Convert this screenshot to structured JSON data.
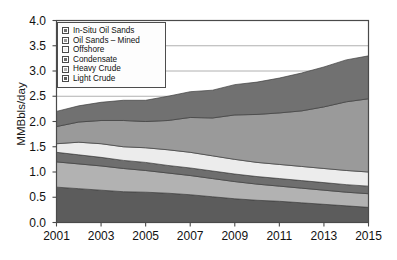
{
  "chart_data": {
    "type": "area",
    "title": "",
    "subtitle": "",
    "xlabel": "",
    "ylabel": "MMBbls/day",
    "stacked": true,
    "grid": true,
    "legend_position": "top-left",
    "xlim": [
      2001,
      2015
    ],
    "ylim": [
      0.0,
      4.0
    ],
    "ytick_labels": [
      "0.0",
      "0.5",
      "1.0",
      "1.5",
      "2.0",
      "2.5",
      "3.0",
      "3.5",
      "4.0"
    ],
    "ytick_values": [
      0.0,
      0.5,
      1.0,
      1.5,
      2.0,
      2.5,
      3.0,
      3.5,
      4.0
    ],
    "xtick_labels": [
      "2001",
      "2003",
      "2005",
      "2007",
      "2009",
      "2011",
      "2013",
      "2015"
    ],
    "xtick_values": [
      2001,
      2003,
      2005,
      2007,
      2009,
      2011,
      2013,
      2015
    ],
    "x": [
      2001,
      2002,
      2003,
      2004,
      2005,
      2006,
      2007,
      2008,
      2009,
      2010,
      2011,
      2012,
      2013,
      2014,
      2015
    ],
    "series": [
      {
        "name": "Light Crude",
        "color": "#5c5c5c",
        "values": [
          0.7,
          0.67,
          0.64,
          0.61,
          0.6,
          0.58,
          0.55,
          0.51,
          0.47,
          0.44,
          0.42,
          0.39,
          0.36,
          0.33,
          0.3
        ]
      },
      {
        "name": "Heavy Crude",
        "color": "#b2b2b2",
        "values": [
          0.5,
          0.49,
          0.48,
          0.46,
          0.43,
          0.4,
          0.38,
          0.36,
          0.34,
          0.32,
          0.3,
          0.29,
          0.28,
          0.27,
          0.27
        ]
      },
      {
        "name": "Condensate",
        "color": "#6e6e6e",
        "values": [
          0.19,
          0.18,
          0.17,
          0.16,
          0.16,
          0.15,
          0.15,
          0.15,
          0.15,
          0.15,
          0.15,
          0.15,
          0.15,
          0.15,
          0.15
        ]
      },
      {
        "name": "Offshore",
        "color": "#ececec",
        "values": [
          0.17,
          0.25,
          0.27,
          0.27,
          0.29,
          0.31,
          0.31,
          0.3,
          0.29,
          0.28,
          0.28,
          0.28,
          0.28,
          0.28,
          0.28
        ]
      },
      {
        "name": "Oil Sands – Mined",
        "color": "#9a9a9a",
        "values": [
          0.34,
          0.4,
          0.46,
          0.52,
          0.52,
          0.58,
          0.69,
          0.75,
          0.88,
          0.95,
          1.02,
          1.1,
          1.22,
          1.36,
          1.45
        ]
      },
      {
        "name": "In-Situ Oil Sands",
        "color": "#717171",
        "values": [
          0.3,
          0.32,
          0.36,
          0.4,
          0.42,
          0.48,
          0.51,
          0.55,
          0.6,
          0.64,
          0.69,
          0.75,
          0.79,
          0.83,
          0.85
        ]
      }
    ],
    "totals": [
      2.2,
      2.31,
      2.38,
      2.42,
      2.42,
      2.5,
      2.59,
      2.62,
      2.73,
      2.78,
      2.86,
      2.96,
      3.08,
      3.22,
      3.3
    ]
  },
  "legend": {
    "items": [
      {
        "label": "In-Situ Oil Sands",
        "color": "#717171"
      },
      {
        "label": "Oil Sands – Mined",
        "color": "#9a9a9a"
      },
      {
        "label": "Offshore",
        "color": "#ececec"
      },
      {
        "label": "Condensate",
        "color": "#6e6e6e"
      },
      {
        "label": "Heavy Crude",
        "color": "#b2b2b2"
      },
      {
        "label": "Light Crude",
        "color": "#5c5c5c"
      }
    ]
  },
  "style": {
    "plot_background": "#ffffff",
    "frame_color": "#4a4a4a",
    "grid_color": "#9d9d9d",
    "text_color": "#111111"
  }
}
